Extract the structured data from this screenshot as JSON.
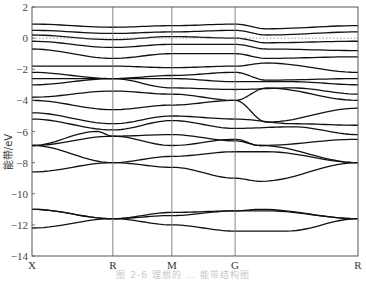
{
  "chart_data": {
    "type": "line",
    "title": "",
    "caption": "图 2-6  理想的 … 能带结构图",
    "xlabel": "",
    "ylabel": "能带/eV",
    "ylim": [
      -14,
      2
    ],
    "yticks": [
      2,
      0,
      -2,
      -4,
      -6,
      -8,
      -10,
      -12,
      -14
    ],
    "x_kpoints": [
      "X",
      "R",
      "M",
      "G",
      "R"
    ],
    "x_kpoint_positions": [
      0,
      0.248,
      0.429,
      0.623,
      1.0
    ],
    "fermi_level": 0,
    "grid": false,
    "legend": null,
    "series_description": "Electronic band structure; dense bands between -6 and 1 eV, bands near -6 to -9 eV, and bands near -11 to -12.5 eV",
    "series": [
      {
        "name": "band-1",
        "points": [
          [
            0,
            -12.2
          ],
          [
            0.248,
            -11.6
          ],
          [
            0.429,
            -12.0
          ],
          [
            0.623,
            -12.4
          ],
          [
            0.78,
            -12.4
          ],
          [
            1.0,
            -11.6
          ]
        ]
      },
      {
        "name": "band-2",
        "points": [
          [
            0,
            -11.0
          ],
          [
            0.248,
            -11.6
          ],
          [
            0.429,
            -11.4
          ],
          [
            0.623,
            -11.1
          ],
          [
            0.7,
            -11.0
          ],
          [
            1.0,
            -11.6
          ]
        ]
      },
      {
        "name": "band-3",
        "points": [
          [
            0,
            -11.0
          ],
          [
            0.248,
            -11.6
          ],
          [
            0.429,
            -11.2
          ],
          [
            0.623,
            -11.1
          ],
          [
            0.72,
            -11.1
          ],
          [
            1.0,
            -11.6
          ]
        ]
      },
      {
        "name": "band-4",
        "points": [
          [
            0,
            -8.6
          ],
          [
            0.248,
            -8.0
          ],
          [
            0.429,
            -7.6
          ],
          [
            0.623,
            -7.3
          ],
          [
            0.72,
            -7.3
          ],
          [
            1.0,
            -8.0
          ]
        ]
      },
      {
        "name": "band-5",
        "points": [
          [
            0,
            -6.9
          ],
          [
            0.248,
            -8.0
          ],
          [
            0.429,
            -8.3
          ],
          [
            0.623,
            -9.0
          ],
          [
            0.7,
            -9.2
          ],
          [
            1.0,
            -8.0
          ]
        ]
      },
      {
        "name": "band-6",
        "points": [
          [
            0,
            -6.9
          ],
          [
            0.248,
            -6.3
          ],
          [
            0.429,
            -6.9
          ],
          [
            0.623,
            -6.5
          ],
          [
            0.7,
            -6.9
          ],
          [
            1.0,
            -8.0
          ]
        ]
      },
      {
        "name": "band-7",
        "points": [
          [
            0,
            -6.9
          ],
          [
            0.2,
            -6.0
          ],
          [
            0.248,
            -6.3
          ],
          [
            0.429,
            -6.2
          ],
          [
            0.623,
            -6.6
          ],
          [
            0.7,
            -6.9
          ],
          [
            1.0,
            -6.5
          ]
        ]
      },
      {
        "name": "band-8",
        "points": [
          [
            0,
            -5.2
          ],
          [
            0.248,
            -5.9
          ],
          [
            0.429,
            -5.3
          ],
          [
            0.623,
            -5.8
          ],
          [
            0.8,
            -5.7
          ],
          [
            1.0,
            -6.2
          ]
        ]
      },
      {
        "name": "band-9",
        "points": [
          [
            0,
            -4.8
          ],
          [
            0.248,
            -5.5
          ],
          [
            0.429,
            -5.0
          ],
          [
            0.623,
            -5.2
          ],
          [
            0.8,
            -5.5
          ],
          [
            1.0,
            -5.6
          ]
        ]
      },
      {
        "name": "band-10",
        "points": [
          [
            0,
            -4.0
          ],
          [
            0.248,
            -4.6
          ],
          [
            0.429,
            -4.3
          ],
          [
            0.623,
            -4.0
          ],
          [
            0.72,
            -5.4
          ],
          [
            1.0,
            -4.5
          ]
        ]
      },
      {
        "name": "band-11",
        "points": [
          [
            0,
            -3.8
          ],
          [
            0.248,
            -3.4
          ],
          [
            0.429,
            -3.6
          ],
          [
            0.623,
            -4.0
          ],
          [
            0.72,
            -3.2
          ],
          [
            1.0,
            -4.0
          ]
        ]
      },
      {
        "name": "band-12",
        "points": [
          [
            0,
            -3.0
          ],
          [
            0.248,
            -2.6
          ],
          [
            0.429,
            -3.2
          ],
          [
            0.623,
            -3.3
          ],
          [
            0.8,
            -3.2
          ],
          [
            1.0,
            -3.6
          ]
        ]
      },
      {
        "name": "band-13",
        "points": [
          [
            0,
            -2.6
          ],
          [
            0.248,
            -2.6
          ],
          [
            0.429,
            -2.6
          ],
          [
            0.623,
            -2.8
          ],
          [
            0.8,
            -2.8
          ],
          [
            1.0,
            -3.0
          ]
        ]
      },
      {
        "name": "band-14",
        "points": [
          [
            0,
            -2.2
          ],
          [
            0.248,
            -2.6
          ],
          [
            0.429,
            -2.4
          ],
          [
            0.623,
            -2.2
          ],
          [
            0.72,
            -2.7
          ],
          [
            1.0,
            -2.6
          ]
        ]
      },
      {
        "name": "band-15",
        "points": [
          [
            0,
            -1.8
          ],
          [
            0.248,
            -1.8
          ],
          [
            0.429,
            -1.9
          ],
          [
            0.623,
            -1.8
          ],
          [
            0.72,
            -1.6
          ],
          [
            1.0,
            -2.2
          ]
        ]
      },
      {
        "name": "band-16",
        "points": [
          [
            0,
            -0.7
          ],
          [
            0.248,
            -1.3
          ],
          [
            0.429,
            -1.0
          ],
          [
            0.623,
            -1.0
          ],
          [
            0.72,
            -1.3
          ],
          [
            1.0,
            -1.2
          ]
        ]
      },
      {
        "name": "band-17",
        "points": [
          [
            0,
            -0.2
          ],
          [
            0.248,
            -0.6
          ],
          [
            0.429,
            -0.4
          ],
          [
            0.623,
            -0.4
          ],
          [
            0.72,
            -0.7
          ],
          [
            1.0,
            -0.8
          ]
        ]
      },
      {
        "name": "band-18",
        "points": [
          [
            0,
            0.2
          ],
          [
            0.248,
            -0.1
          ],
          [
            0.429,
            0.1
          ],
          [
            0.623,
            0.0
          ],
          [
            0.72,
            -0.3
          ],
          [
            1.0,
            -0.2
          ]
        ]
      },
      {
        "name": "band-19",
        "points": [
          [
            0,
            0.5
          ],
          [
            0.248,
            0.3
          ],
          [
            0.429,
            0.4
          ],
          [
            0.623,
            0.5
          ],
          [
            0.72,
            0.2
          ],
          [
            1.0,
            0.4
          ]
        ]
      },
      {
        "name": "band-20",
        "points": [
          [
            0,
            0.9
          ],
          [
            0.248,
            0.7
          ],
          [
            0.429,
            0.8
          ],
          [
            0.623,
            0.9
          ],
          [
            0.72,
            0.6
          ],
          [
            1.0,
            0.8
          ]
        ]
      }
    ]
  },
  "axes": {
    "ylabel": "能带/eV",
    "yticks": [
      "2",
      "0",
      "-2",
      "-4",
      "-6",
      "-8",
      "-10",
      "-12",
      "-14"
    ],
    "kpoints": [
      "X",
      "R",
      "M",
      "G",
      "R"
    ]
  },
  "caption": "图 2-6  理想的 … 能带结构图"
}
